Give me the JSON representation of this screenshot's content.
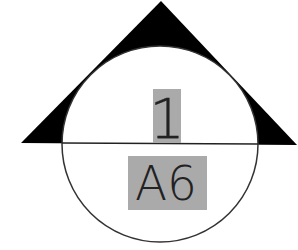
{
  "diagram": {
    "type": "section-callout-symbol",
    "detail_number": "1",
    "sheet_number": "A6",
    "colors": {
      "background": "#ffffff",
      "triangle_fill": "#000000",
      "circle_stroke": "#333333",
      "label_highlight": "#aaaaaa",
      "text": "#222222"
    }
  }
}
